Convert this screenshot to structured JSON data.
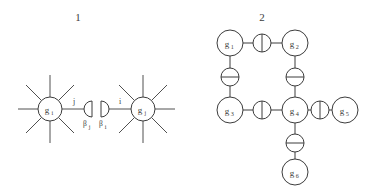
{
  "figure": {
    "type": "diagram",
    "background_color": "#ffffff",
    "stroke_color": "#3c3c3c",
    "text_color": "#3c3c3c",
    "panels": [
      {
        "id": "panel-1",
        "label": "1",
        "label_pos": {
          "x": 78,
          "y": 20
        },
        "description": "Two high-degree vertices joined through a pair of opposed half-disc (boundary) elements",
        "nodes": [
          {
            "id": "gi",
            "label": "g",
            "sub": "i",
            "cx": 50,
            "cy": 109,
            "r": 12,
            "spokes": 8
          },
          {
            "id": "gj",
            "label": "g",
            "sub": "j",
            "cx": 143,
            "cy": 109,
            "r": 12,
            "spokes": 8
          }
        ],
        "half_discs": [
          {
            "id": "beta-j-disc",
            "cx": 90,
            "cy": 109,
            "r": 8,
            "facing": "right"
          },
          {
            "id": "beta-i-disc",
            "cx": 103,
            "cy": 109,
            "r": 8,
            "facing": "left"
          }
        ],
        "edge_labels": [
          {
            "id": "label-j",
            "text": "j",
            "x": 74,
            "y": 104
          },
          {
            "id": "label-i",
            "text": "i",
            "x": 119,
            "y": 104
          }
        ],
        "beta_labels": [
          {
            "id": "beta-j",
            "base": "β",
            "sub": "j",
            "x": 85,
            "y": 125
          },
          {
            "id": "beta-i",
            "base": "β",
            "sub": "i",
            "x": 101,
            "y": 125
          }
        ]
      },
      {
        "id": "panel-2",
        "label": "2",
        "label_pos": {
          "x": 262,
          "y": 20
        },
        "description": "Graph of six vertices g1..g6 whose edges each carry a circular decoration",
        "nodes": [
          {
            "id": "g1",
            "label": "g",
            "sub": "1",
            "cx": 230,
            "cy": 43,
            "r": 13
          },
          {
            "id": "g2",
            "label": "g",
            "sub": "2",
            "cx": 295,
            "cy": 43,
            "r": 13
          },
          {
            "id": "g3",
            "label": "g",
            "sub": "3",
            "cx": 230,
            "cy": 110,
            "r": 13
          },
          {
            "id": "g4",
            "label": "g",
            "sub": "4",
            "cx": 295,
            "cy": 110,
            "r": 13
          },
          {
            "id": "g5",
            "label": "g",
            "sub": "5",
            "cx": 345,
            "cy": 110,
            "r": 13
          },
          {
            "id": "g6",
            "label": "g",
            "sub": "6",
            "cx": 295,
            "cy": 172,
            "r": 13
          }
        ],
        "edges": [
          {
            "id": "edge-g1-g2",
            "from": "g1",
            "to": "g2",
            "orientation": "horizontal",
            "marker": "vertical-bar-circle",
            "mx": 262,
            "my": 43
          },
          {
            "id": "edge-g1-g3",
            "from": "g1",
            "to": "g3",
            "orientation": "vertical",
            "marker": "horizontal-bar-circle",
            "mx": 230,
            "my": 77
          },
          {
            "id": "edge-g2-g4",
            "from": "g2",
            "to": "g4",
            "orientation": "vertical",
            "marker": "horizontal-bar-circle",
            "mx": 295,
            "my": 77
          },
          {
            "id": "edge-g3-g4",
            "from": "g3",
            "to": "g4",
            "orientation": "horizontal",
            "marker": "vertical-bar-circle",
            "mx": 262,
            "my": 110
          },
          {
            "id": "edge-g4-g5",
            "from": "g4",
            "to": "g5",
            "orientation": "horizontal",
            "marker": "vertical-bar-circle",
            "mx": 320,
            "my": 110
          },
          {
            "id": "edge-g4-g6",
            "from": "g4",
            "to": "g6",
            "orientation": "vertical",
            "marker": "horizontal-bar-circle",
            "mx": 295,
            "my": 143
          }
        ],
        "marker_radius": 9
      }
    ]
  }
}
